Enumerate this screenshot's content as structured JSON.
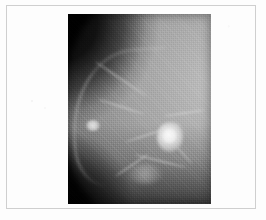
{
  "figure": {
    "kind": "medical-radiograph",
    "modality": "mammogram",
    "caption": "",
    "canvas": {
      "width_px": 266,
      "height_px": 220,
      "background_color": "#fdfdfd"
    },
    "frame": {
      "visible": true,
      "color": "#cfcfcf",
      "x_px": 6,
      "y_px": 5,
      "width_px": 250,
      "height_px": 204
    },
    "image": {
      "name": "mammogram-scan",
      "x_px": 68,
      "y_px": 14,
      "width_px": 143,
      "height_px": 190,
      "background_color": "#121212",
      "tissue_color": "#a6a6a6",
      "highlight_color": "#f2f2f2",
      "description": "Grayscale mammographic projection; dark film background occupies the upper-left and lower-left corners, bright glandular breast tissue sweeps from the upper right and curves toward the lower left, with a focal high-density rounded mass near the centre-right and a small bright skin-line marker at the left margin.",
      "features": [
        {
          "name": "dark-background-region",
          "label": "Dark film background",
          "location": "upper-left and lower-left corners",
          "gray_level": "#0d0d0d"
        },
        {
          "name": "breast-tissue-region",
          "label": "Glandular breast tissue",
          "location": "centre to right, curving down-left",
          "gray_level": "#a6a6a6"
        },
        {
          "name": "skin-edge-line",
          "label": "Skin line / anterior breast border",
          "location": "left diagonal margin",
          "gray_level": "#cdcdcd"
        },
        {
          "name": "focal-mass-lesion",
          "label": "Focal high-density mass",
          "location": "centre-right of the breast",
          "gray_level": "#f2f2f2"
        },
        {
          "name": "nipple-marker-spot",
          "label": "Nipple / skin marker",
          "location": "left skin margin, mid height",
          "gray_level": "#e4e4e4"
        },
        {
          "name": "trabecular-strands",
          "label": "Trabecular and ductal strands",
          "location": "throughout the tissue",
          "gray_level": "#e2e2e2"
        }
      ]
    }
  }
}
